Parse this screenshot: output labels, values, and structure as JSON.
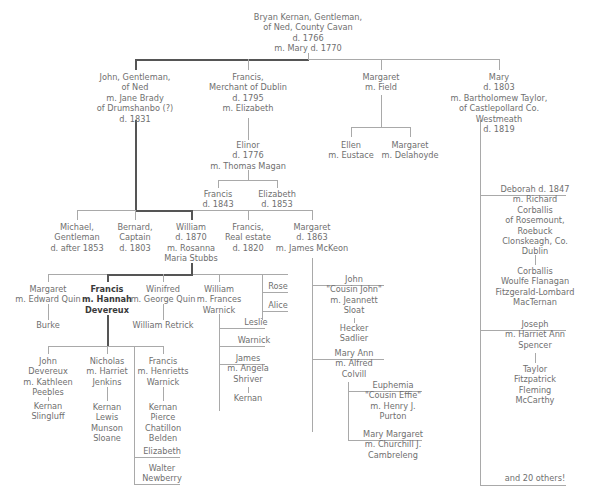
{
  "colors": {
    "text": "#6f6f6f",
    "line": "#a9a9a9",
    "direct_line": "#555555",
    "background": "#ffffff"
  },
  "root": {
    "lines": [
      "Bryan Kernan, Gentleman,",
      "of Ned, County Cavan",
      "d. 1766",
      "m. Mary d. 1770"
    ]
  },
  "gen1": {
    "john": {
      "lines": [
        "John, Gentleman,",
        "of Ned",
        "m. Jane Brady",
        "of Drumshanbo (?)",
        "d. 1831"
      ]
    },
    "francis": {
      "lines": [
        "Francis,",
        "Merchant of Dublin",
        "d. 1795",
        "m. Elizabeth"
      ]
    },
    "margaret": {
      "lines": [
        "Margaret",
        "m. Field"
      ]
    },
    "mary": {
      "lines": [
        "Mary",
        "d. 1803",
        "m. Bartholomew Taylor,",
        "of Castlepollard Co.",
        "Westmeath",
        "d. 1819"
      ]
    }
  },
  "field_children": {
    "ellen": {
      "lines": [
        "Ellen",
        "m. Eustace"
      ]
    },
    "margaret": {
      "lines": [
        "Margaret",
        "m. Delahoyde"
      ]
    }
  },
  "elinor": {
    "lines": [
      "Elinor",
      "d. 1776",
      "m. Thomas Magan"
    ]
  },
  "magan_children": {
    "francis": {
      "lines": [
        "Francis",
        "d. 1843"
      ]
    },
    "elizabeth": {
      "lines": [
        "Elizabeth",
        "d. 1853"
      ]
    }
  },
  "gen2": {
    "michael": {
      "lines": [
        "Michael,",
        "Gentleman",
        "d. after 1853"
      ]
    },
    "bernard": {
      "lines": [
        "Bernard,",
        "Captain",
        "d. 1803"
      ]
    },
    "william": {
      "lines": [
        "William",
        "d. 1870",
        "m. Rosanna",
        "Maria Stubbs"
      ]
    },
    "francis": {
      "lines": [
        "Francis,",
        "Real estate",
        "d. 1820"
      ]
    },
    "margaret": {
      "lines": [
        "Margaret",
        "d. 1863",
        "m. James McKeon"
      ]
    }
  },
  "gen3": {
    "margaret": {
      "lines": [
        "Margaret",
        "m. Edward Quin"
      ]
    },
    "francis": {
      "lines": [
        "Francis",
        "m. Hannah",
        "Devereux"
      ]
    },
    "winifred": {
      "lines": [
        "Winifred",
        "m. George Quin"
      ]
    },
    "william": {
      "lines": [
        "William",
        "m. Frances",
        "Warnick"
      ]
    },
    "rose": {
      "lines": [
        "Rose"
      ]
    },
    "alice": {
      "lines": [
        "Alice"
      ]
    }
  },
  "burke": {
    "lines": [
      "Burke"
    ]
  },
  "william_retrick": {
    "lines": [
      "William Retrick"
    ]
  },
  "warnick_children": {
    "leslie": {
      "lines": [
        "Leslie"
      ]
    },
    "warnick": {
      "lines": [
        "Warnick"
      ]
    },
    "james": {
      "lines": [
        "James",
        "m. Angela",
        "Shriver"
      ]
    },
    "kernan": {
      "lines": [
        "Kernan"
      ]
    }
  },
  "mckeon_children": {
    "john": {
      "lines": [
        "John",
        "\"Cousin John\"",
        "m. Jeannett",
        "Sloat"
      ]
    },
    "john_desc": {
      "lines": [
        "Hecker",
        "Sadlier"
      ]
    },
    "mary_ann": {
      "lines": [
        "Mary Ann",
        "m. Alfred",
        "Colvill"
      ]
    }
  },
  "colvill_children": {
    "euphemia": {
      "lines": [
        "Euphemia",
        "\"Cousin Effie\"",
        "m. Henry J.",
        "Purton"
      ]
    },
    "mary_margaret": {
      "lines": [
        "Mary Margaret",
        "m. Churchill J.",
        "Cambreleng"
      ]
    }
  },
  "gen4": {
    "john": {
      "lines": [
        "John",
        "Devereux",
        "m. Kathleen",
        "Peebles"
      ]
    },
    "john_desc": {
      "lines": [
        "Kernan",
        "Slingluff"
      ]
    },
    "nicholas": {
      "lines": [
        "Nicholas",
        "m. Harriet",
        "Jenkins"
      ]
    },
    "nicholas_desc": {
      "lines": [
        "Kernan",
        "Lewis",
        "Munson",
        "Sloane"
      ]
    },
    "francis": {
      "lines": [
        "Francis",
        "m. Henrietts",
        "Warnick"
      ]
    },
    "francis_desc": {
      "lines": [
        "Kernan",
        "Pierce",
        "Chatillon",
        "Belden"
      ]
    },
    "elizabeth": {
      "lines": [
        "Elizabeth"
      ]
    },
    "walter": {
      "lines": [
        "Walter",
        "Newberry"
      ]
    }
  },
  "taylor_children": {
    "deborah": {
      "lines": [
        "Deborah d. 1847",
        "m. Richard",
        "Corballis",
        "of Rosemount,",
        "Roebuck",
        "Clonskeagh, Co.",
        "Dublin"
      ]
    },
    "deborah_desc": {
      "lines": [
        "Corballis",
        "Woulfe Flanagan",
        "Fitzgerald-Lombard",
        "MacTernan"
      ]
    },
    "joseph": {
      "lines": [
        "Joseph",
        "m. Harriet Ann",
        "Spencer"
      ]
    },
    "joseph_desc": {
      "lines": [
        "Taylor",
        "Fitzpatrick",
        "Fleming",
        "McCarthy"
      ]
    },
    "others": {
      "lines": [
        "and 20 others!"
      ]
    }
  }
}
